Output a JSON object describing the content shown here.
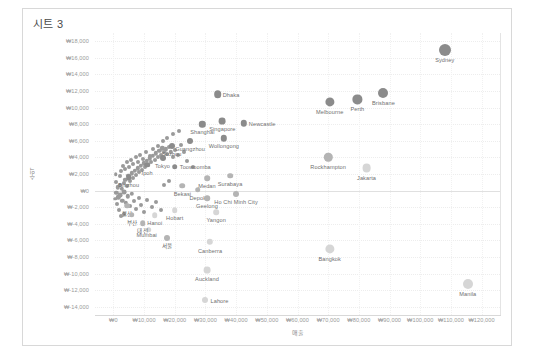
{
  "worksheet": {
    "title": "시트 3"
  },
  "chart_data": {
    "type": "scatter",
    "title": "시트 3",
    "xlabel": "매출",
    "ylabel": "수익",
    "xlim": [
      -6000,
      126000
    ],
    "ylim": [
      -15000,
      19000
    ],
    "grid": true,
    "legend": null,
    "x_ticks": [
      "₩0",
      "₩10,000",
      "₩20,000",
      "₩30,000",
      "₩40,000",
      "₩50,000",
      "₩60,000",
      "₩70,000",
      "₩80,000",
      "₩90,000",
      "₩100,000",
      "₩110,000",
      "₩120,000"
    ],
    "x_tick_values": [
      0,
      10000,
      20000,
      30000,
      40000,
      50000,
      60000,
      70000,
      80000,
      90000,
      100000,
      110000,
      120000
    ],
    "y_ticks": [
      "₩18,000",
      "₩16,000",
      "₩14,000",
      "₩12,000",
      "₩10,000",
      "₩8,000",
      "₩6,000",
      "₩4,000",
      "₩2,000",
      "₩0",
      "₩-2,000",
      "₩-4,000",
      "₩-6,000",
      "₩-8,000",
      "₩-10,000",
      "₩-12,000",
      "₩-14,000"
    ],
    "y_tick_values": [
      18000,
      16000,
      14000,
      12000,
      10000,
      8000,
      6000,
      4000,
      2000,
      0,
      -2000,
      -4000,
      -6000,
      -8000,
      -10000,
      -12000,
      -14000
    ],
    "points": [
      {
        "label": "Sydney",
        "x": 108000,
        "y": 17000,
        "size": 6.0,
        "shade": "dark",
        "lx": 0,
        "ly": 7
      },
      {
        "label": "Brisbane",
        "x": 88000,
        "y": 11800,
        "size": 5.0,
        "shade": "dark",
        "lx": 0,
        "ly": 7
      },
      {
        "label": "Perth",
        "x": 79500,
        "y": 11000,
        "size": 4.6,
        "shade": "dark",
        "lx": 0,
        "ly": 7
      },
      {
        "label": "Melbourne",
        "x": 70500,
        "y": 10700,
        "size": 4.6,
        "shade": "dark",
        "lx": 0,
        "ly": 7
      },
      {
        "label": "Rockhampton",
        "x": 70000,
        "y": 4000,
        "size": 4.2,
        "shade": "mid",
        "lx": 0,
        "ly": 7
      },
      {
        "label": "Jakarta",
        "x": 82500,
        "y": 2700,
        "size": 4.4,
        "shade": "light",
        "lx": 0,
        "ly": 7
      },
      {
        "label": "Bangkok",
        "x": 70500,
        "y": -7000,
        "size": 4.6,
        "shade": "light",
        "lx": 0,
        "ly": 7
      },
      {
        "label": "Manila",
        "x": 115500,
        "y": -11300,
        "size": 5.0,
        "shade": "light",
        "lx": 0,
        "ly": 7
      },
      {
        "label": "Dhaka",
        "x": 34000,
        "y": 11600,
        "size": 3.8,
        "shade": "dark",
        "lx": 5,
        "ly": -2.5
      },
      {
        "label": "Singapore",
        "x": 35500,
        "y": 8400,
        "size": 3.4,
        "shade": "dark",
        "lx": 0,
        "ly": 5
      },
      {
        "label": "Newcastle",
        "x": 42500,
        "y": 8100,
        "size": 3.2,
        "shade": "dark",
        "lx": 5,
        "ly": -2.5
      },
      {
        "label": "Shanghai",
        "x": 29000,
        "y": 8000,
        "size": 3.2,
        "shade": "dark",
        "lx": 0,
        "ly": 5
      },
      {
        "label": "Wollongong",
        "x": 36000,
        "y": 6300,
        "size": 3.2,
        "shade": "dark",
        "lx": 0,
        "ly": 5
      },
      {
        "label": "Guangzhou",
        "x": 25000,
        "y": 6000,
        "size": 3.0,
        "shade": "dark",
        "lx": 0,
        "ly": 5
      },
      {
        "label": "Suzhou",
        "x": 19000,
        "y": 5400,
        "size": 3.0,
        "shade": "dark",
        "lx": 0,
        "ly": 5
      },
      {
        "label": "Tokyo",
        "x": 16000,
        "y": 3900,
        "size": 3.0,
        "shade": "dark",
        "lx": 0,
        "ly": 5
      },
      {
        "label": "Ipoh",
        "x": 11000,
        "y": 3100,
        "size": 2.8,
        "shade": "dark",
        "lx": 0,
        "ly": 5
      },
      {
        "label": "Toowoomba",
        "x": 20000,
        "y": 2900,
        "size": 2.8,
        "shade": "dark",
        "lx": 5,
        "ly": -2.5
      },
      {
        "label": "Binzhou",
        "x": 5000,
        "y": 1600,
        "size": 2.8,
        "shade": "dark",
        "lx": 0,
        "ly": 5
      },
      {
        "label": "Bekasi",
        "x": 22500,
        "y": 600,
        "size": 2.8,
        "shade": "mid",
        "lx": 0,
        "ly": 5
      },
      {
        "label": "Depok",
        "x": 27500,
        "y": 100,
        "size": 2.8,
        "shade": "mid",
        "lx": 0,
        "ly": 5
      },
      {
        "label": "Medan",
        "x": 30500,
        "y": 1500,
        "size": 2.8,
        "shade": "mid",
        "lx": 0,
        "ly": 5
      },
      {
        "label": "Surabaya",
        "x": 38000,
        "y": 1800,
        "size": 2.8,
        "shade": "mid",
        "lx": 0,
        "ly": 5
      },
      {
        "label": "Ho Chi Minh City",
        "x": 40000,
        "y": -400,
        "size": 3.0,
        "shade": "mid",
        "lx": 0,
        "ly": 5
      },
      {
        "label": "Geelong",
        "x": 30500,
        "y": -900,
        "size": 2.8,
        "shade": "mid",
        "lx": 0,
        "ly": 5
      },
      {
        "label": "Yangon",
        "x": 33500,
        "y": -2600,
        "size": 2.8,
        "shade": "light",
        "lx": 0,
        "ly": 5
      },
      {
        "label": "Hobart",
        "x": 20000,
        "y": -2400,
        "size": 2.8,
        "shade": "light",
        "lx": 0,
        "ly": 5
      },
      {
        "label": "Hanoi",
        "x": 13500,
        "y": -3000,
        "size": 2.8,
        "shade": "light",
        "lx": 0,
        "ly": 5
      },
      {
        "label": "Mumbai",
        "x": 11500,
        "y": -4700,
        "size": 2.8,
        "shade": "light",
        "lx": -2,
        "ly": 2
      },
      {
        "label": "Canberra",
        "x": 31500,
        "y": -6200,
        "size": 3.2,
        "shade": "light",
        "lx": 0,
        "ly": 6
      },
      {
        "label": "Auckland",
        "x": 30500,
        "y": -9600,
        "size": 3.4,
        "shade": "light",
        "lx": 0,
        "ly": 6
      },
      {
        "label": "Lahore",
        "x": 30000,
        "y": -13200,
        "size": 3.0,
        "shade": "light",
        "lx": 5,
        "ly": -2.5
      },
      {
        "label": "울산",
        "x": 4500,
        "y": -1800,
        "size": 2.8,
        "shade": "mid",
        "lx": 0,
        "ly": 4
      },
      {
        "label": "부산",
        "x": 6000,
        "y": -2900,
        "size": 2.8,
        "shade": "mid",
        "lx": 0,
        "ly": 4
      },
      {
        "label": "대전",
        "x": 9500,
        "y": -3900,
        "size": 2.8,
        "shade": "mid",
        "lx": 0,
        "ly": 4
      },
      {
        "label": "서울",
        "x": 17500,
        "y": -5700,
        "size": 3.0,
        "shade": "mid",
        "lx": 0,
        "ly": 4
      }
    ],
    "cluster_points": [
      {
        "x": 1500,
        "y": 400,
        "size": 2.2
      },
      {
        "x": 2200,
        "y": 700,
        "size": 2.0
      },
      {
        "x": 2800,
        "y": 200,
        "size": 2.2
      },
      {
        "x": 3300,
        "y": 900,
        "size": 2.0
      },
      {
        "x": 3900,
        "y": 1300,
        "size": 2.2
      },
      {
        "x": 4400,
        "y": 500,
        "size": 2.0
      },
      {
        "x": 4900,
        "y": 1800,
        "size": 2.2
      },
      {
        "x": 5400,
        "y": 1100,
        "size": 2.0
      },
      {
        "x": 5900,
        "y": 2100,
        "size": 2.2
      },
      {
        "x": 6400,
        "y": 1500,
        "size": 2.0
      },
      {
        "x": 6900,
        "y": 2400,
        "size": 2.2
      },
      {
        "x": 7400,
        "y": 1900,
        "size": 2.0
      },
      {
        "x": 7900,
        "y": 2700,
        "size": 2.2
      },
      {
        "x": 8400,
        "y": 2200,
        "size": 2.0
      },
      {
        "x": 8900,
        "y": 3000,
        "size": 2.2
      },
      {
        "x": 9400,
        "y": 2500,
        "size": 2.0
      },
      {
        "x": 9900,
        "y": 3300,
        "size": 2.2
      },
      {
        "x": 10400,
        "y": 2800,
        "size": 2.0
      },
      {
        "x": 10900,
        "y": 3600,
        "size": 2.2
      },
      {
        "x": 11400,
        "y": 3100,
        "size": 2.0
      },
      {
        "x": 11900,
        "y": 3900,
        "size": 2.2
      },
      {
        "x": 12400,
        "y": 3400,
        "size": 2.0
      },
      {
        "x": 12900,
        "y": 4200,
        "size": 2.2
      },
      {
        "x": 13400,
        "y": 3700,
        "size": 2.0
      },
      {
        "x": 13900,
        "y": 4500,
        "size": 2.2
      },
      {
        "x": 14400,
        "y": 4000,
        "size": 2.0
      },
      {
        "x": 14900,
        "y": 4800,
        "size": 2.2
      },
      {
        "x": 15400,
        "y": 4300,
        "size": 2.0
      },
      {
        "x": 15900,
        "y": 5100,
        "size": 2.2
      },
      {
        "x": 16400,
        "y": 4600,
        "size": 2.0
      },
      {
        "x": 17000,
        "y": 5000,
        "size": 2.2
      },
      {
        "x": 17600,
        "y": 4400,
        "size": 2.0
      },
      {
        "x": 18200,
        "y": 5300,
        "size": 2.0
      },
      {
        "x": 18800,
        "y": 4700,
        "size": 2.2
      },
      {
        "x": 19400,
        "y": 4100,
        "size": 2.0
      },
      {
        "x": 20000,
        "y": 4900,
        "size": 2.0
      },
      {
        "x": 21000,
        "y": 4300,
        "size": 2.0
      },
      {
        "x": 22000,
        "y": 5500,
        "size": 2.0
      },
      {
        "x": 23000,
        "y": 4700,
        "size": 2.0
      },
      {
        "x": 1000,
        "y": -300,
        "size": 2.2
      },
      {
        "x": 1600,
        "y": -800,
        "size": 2.2
      },
      {
        "x": 2300,
        "y": -500,
        "size": 2.4
      },
      {
        "x": 2900,
        "y": -1200,
        "size": 2.2
      },
      {
        "x": 3500,
        "y": -200,
        "size": 2.4
      },
      {
        "x": 4100,
        "y": -1500,
        "size": 2.2
      },
      {
        "x": 4700,
        "y": -700,
        "size": 2.2
      },
      {
        "x": 5300,
        "y": -1900,
        "size": 2.0
      },
      {
        "x": 6000,
        "y": -400,
        "size": 2.2
      },
      {
        "x": 6700,
        "y": -1300,
        "size": 2.0
      },
      {
        "x": 7500,
        "y": -2200,
        "size": 2.0
      },
      {
        "x": 8300,
        "y": -900,
        "size": 2.0
      },
      {
        "x": 9000,
        "y": -1700,
        "size": 2.0
      },
      {
        "x": 10000,
        "y": -2600,
        "size": 2.0
      },
      {
        "x": 11000,
        "y": -1100,
        "size": 2.0
      },
      {
        "x": 12500,
        "y": -2000,
        "size": 2.0
      },
      {
        "x": 14000,
        "y": -1400,
        "size": 2.0
      },
      {
        "x": 15500,
        "y": -2300,
        "size": 2.0
      },
      {
        "x": 2000,
        "y": 1800,
        "size": 2.0
      },
      {
        "x": 2600,
        "y": 2400,
        "size": 2.0
      },
      {
        "x": 3200,
        "y": 3000,
        "size": 2.0
      },
      {
        "x": 3800,
        "y": 2600,
        "size": 2.0
      },
      {
        "x": 4500,
        "y": 3400,
        "size": 2.0
      },
      {
        "x": 5200,
        "y": 2900,
        "size": 2.0
      },
      {
        "x": 5800,
        "y": 3700,
        "size": 2.0
      },
      {
        "x": 6500,
        "y": 3200,
        "size": 2.0
      },
      {
        "x": 7200,
        "y": 4000,
        "size": 2.0
      },
      {
        "x": 8000,
        "y": 3500,
        "size": 2.0
      },
      {
        "x": 8800,
        "y": 4300,
        "size": 2.0
      },
      {
        "x": 9600,
        "y": 3800,
        "size": 2.0
      },
      {
        "x": 10500,
        "y": 4600,
        "size": 2.0
      },
      {
        "x": 11800,
        "y": 4200,
        "size": 2.0
      },
      {
        "x": 13000,
        "y": 5000,
        "size": 2.0
      },
      {
        "x": 14500,
        "y": 5400,
        "size": 2.0
      },
      {
        "x": 16000,
        "y": 6000,
        "size": 2.0
      },
      {
        "x": 17500,
        "y": 6400,
        "size": 2.0
      },
      {
        "x": 800,
        "y": 1000,
        "size": 2.0
      },
      {
        "x": 1200,
        "y": -1600,
        "size": 2.0
      },
      {
        "x": 1800,
        "y": -2400,
        "size": 2.0
      },
      {
        "x": 2500,
        "y": -3100,
        "size": 2.0
      },
      {
        "x": 3600,
        "y": -2800,
        "size": 2.0
      },
      {
        "x": 700,
        "y": 2000,
        "size": 1.8
      },
      {
        "x": 500,
        "y": -1000,
        "size": 1.8
      },
      {
        "x": 19500,
        "y": 6800,
        "size": 2.0
      },
      {
        "x": 21500,
        "y": 7200,
        "size": 2.0
      },
      {
        "x": 24000,
        "y": 3600,
        "size": 2.0
      },
      {
        "x": 26000,
        "y": 2800,
        "size": 2.0
      },
      {
        "x": 18000,
        "y": 1200,
        "size": 2.0
      },
      {
        "x": 16500,
        "y": 700,
        "size": 2.0
      }
    ]
  }
}
